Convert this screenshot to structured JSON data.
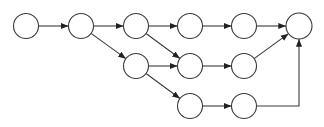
{
  "diagram": {
    "type": "directed-graph",
    "stroke_color": "#3a3a3a",
    "node_fill": "#ffffff",
    "node_radius": 12.5,
    "nodes": [
      {
        "id": "n1",
        "x": 26,
        "y": 26,
        "r": 12.5
      },
      {
        "id": "n2",
        "x": 81,
        "y": 26,
        "r": 12.5
      },
      {
        "id": "n3",
        "x": 136,
        "y": 26,
        "r": 12.5
      },
      {
        "id": "n4",
        "x": 190,
        "y": 26,
        "r": 12.5
      },
      {
        "id": "n5",
        "x": 244,
        "y": 26,
        "r": 12.5
      },
      {
        "id": "n6",
        "x": 299,
        "y": 26,
        "r": 13
      },
      {
        "id": "n7",
        "x": 136,
        "y": 66,
        "r": 12.5
      },
      {
        "id": "n8",
        "x": 190,
        "y": 66,
        "r": 12.5
      },
      {
        "id": "n9",
        "x": 244,
        "y": 66,
        "r": 12.5
      },
      {
        "id": "n10",
        "x": 190,
        "y": 106,
        "r": 12.5
      },
      {
        "id": "n11",
        "x": 244,
        "y": 106,
        "r": 12.5
      }
    ],
    "edges": [
      {
        "from": "n1",
        "to": "n2"
      },
      {
        "from": "n2",
        "to": "n3"
      },
      {
        "from": "n3",
        "to": "n4"
      },
      {
        "from": "n4",
        "to": "n5"
      },
      {
        "from": "n5",
        "to": "n6"
      },
      {
        "from": "n2",
        "to": "n7"
      },
      {
        "from": "n3",
        "to": "n8"
      },
      {
        "from": "n7",
        "to": "n8"
      },
      {
        "from": "n8",
        "to": "n9"
      },
      {
        "from": "n9",
        "to": "n6"
      },
      {
        "from": "n7",
        "to": "n10"
      },
      {
        "from": "n10",
        "to": "n11"
      },
      {
        "from": "n11",
        "to": "n6",
        "route": "elbow"
      }
    ]
  }
}
